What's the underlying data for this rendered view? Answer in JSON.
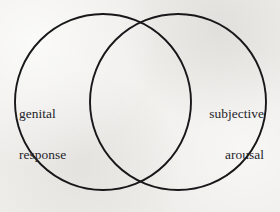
{
  "figure": {
    "type": "venn-diagram",
    "background_color": "#eeedea",
    "stroke_color": "#18181a",
    "text_color": "#24242a",
    "width": 280,
    "height": 212
  },
  "circles": [
    {
      "id": "left",
      "name": "genital-response-circle",
      "cx": 103,
      "cy": 102,
      "r": 88,
      "stroke_width": 1.9
    },
    {
      "id": "right",
      "name": "subjective-arousal-circle",
      "cx": 178,
      "cy": 102,
      "r": 88,
      "stroke_width": 1.9
    }
  ],
  "labels": {
    "left": {
      "line1": "genital",
      "line2": "response"
    },
    "right": {
      "line1": "subjective",
      "line2": "arousal"
    }
  }
}
